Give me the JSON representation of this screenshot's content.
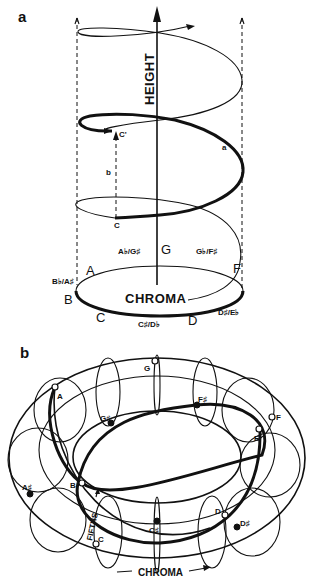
{
  "panels": {
    "a": {
      "label": "a",
      "axis_height_label": "HEIGHT",
      "axis_chroma_label": "CHROMA",
      "helix_path_label": "a",
      "octave_path_label": "b",
      "point_low": "C",
      "point_high": "C'",
      "chroma_notes": [
        {
          "name": "A"
        },
        {
          "name": "A♭/G♯"
        },
        {
          "name": "G"
        },
        {
          "name": "G♭/F♯"
        },
        {
          "name": "F"
        },
        {
          "name": "B♭/A♯"
        },
        {
          "name": "B"
        },
        {
          "name": "C"
        },
        {
          "name": "C♯/D♭"
        },
        {
          "name": "D"
        },
        {
          "name": "D♯/E♭"
        }
      ]
    },
    "b": {
      "label": "b",
      "chroma_label": "CHROMA",
      "fifths_label": "FIFTHS",
      "torus_nodes": [
        {
          "name": "G",
          "style": "open"
        },
        {
          "name": "A",
          "style": "open"
        },
        {
          "name": "G♯",
          "style": "filled"
        },
        {
          "name": "F♯",
          "style": "filled"
        },
        {
          "name": "F",
          "style": "open"
        },
        {
          "name": "E",
          "style": "open"
        },
        {
          "name": "A♯",
          "style": "filled"
        },
        {
          "name": "B",
          "style": "open"
        },
        {
          "name": "C",
          "style": "open"
        },
        {
          "name": "C♯",
          "style": "filled"
        },
        {
          "name": "D",
          "style": "open"
        },
        {
          "name": "D♯",
          "style": "filled"
        }
      ]
    }
  }
}
